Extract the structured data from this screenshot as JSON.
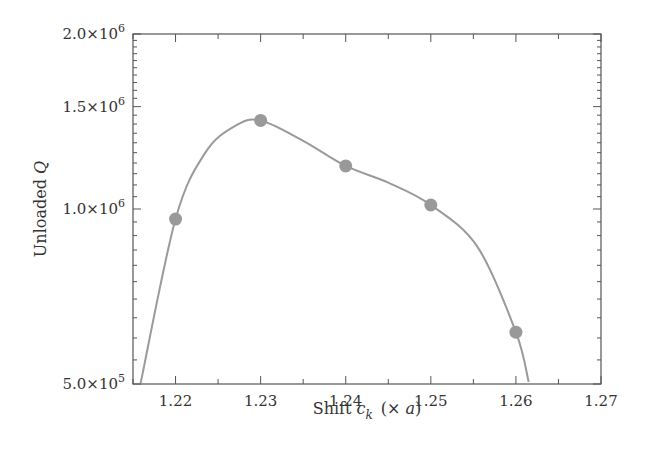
{
  "chart_data": {
    "type": "line",
    "title": "",
    "xlabel": "Shift c_k (× a)",
    "xlabel_parts": {
      "prefix": "Shift ",
      "var": "c",
      "sub": "k",
      "suffix": "(× ",
      "var2": "a",
      "close": ")"
    },
    "ylabel": "Unloaded Q",
    "ylabel_parts": {
      "prefix": "Unloaded ",
      "var": "Q"
    },
    "xlim": [
      1.215,
      1.27
    ],
    "ylim": [
      500000,
      2000000
    ],
    "yscale": "log",
    "x_ticks": [
      1.22,
      1.23,
      1.24,
      1.25,
      1.26,
      1.27
    ],
    "x_tick_labels": [
      "1.22",
      "1.23",
      "1.24",
      "1.25",
      "1.26",
      "1.27"
    ],
    "y_ticks": [
      500000,
      1000000,
      1500000,
      2000000
    ],
    "y_tick_labels": [
      {
        "mant": "5.0×10",
        "exp": "5"
      },
      {
        "mant": "1.0×10",
        "exp": "6"
      },
      {
        "mant": "1.5×10",
        "exp": "6"
      },
      {
        "mant": "2.0×10",
        "exp": "6"
      }
    ],
    "grid": false,
    "legend": null,
    "series": [
      {
        "name": "Unloaded Q (markers)",
        "style": "markers",
        "x": [
          1.22,
          1.23,
          1.24,
          1.25,
          1.26
        ],
        "values": [
          961000,
          1420000,
          1186000,
          1016000,
          614000
        ]
      },
      {
        "name": "Interpolated fit",
        "style": "smooth-line",
        "x": [
          1.2159,
          1.22,
          1.2235,
          1.227,
          1.23,
          1.235,
          1.24,
          1.245,
          1.25,
          1.2555,
          1.26,
          1.2615
        ],
        "values": [
          502000,
          961000,
          1250000,
          1390000,
          1420000,
          1310000,
          1186000,
          1110000,
          1016000,
          860000,
          614000,
          504000
        ]
      }
    ],
    "colors": {
      "line": "#9a9a9a",
      "marker": "#999999",
      "axis": "#555555",
      "text": "#333333"
    }
  }
}
